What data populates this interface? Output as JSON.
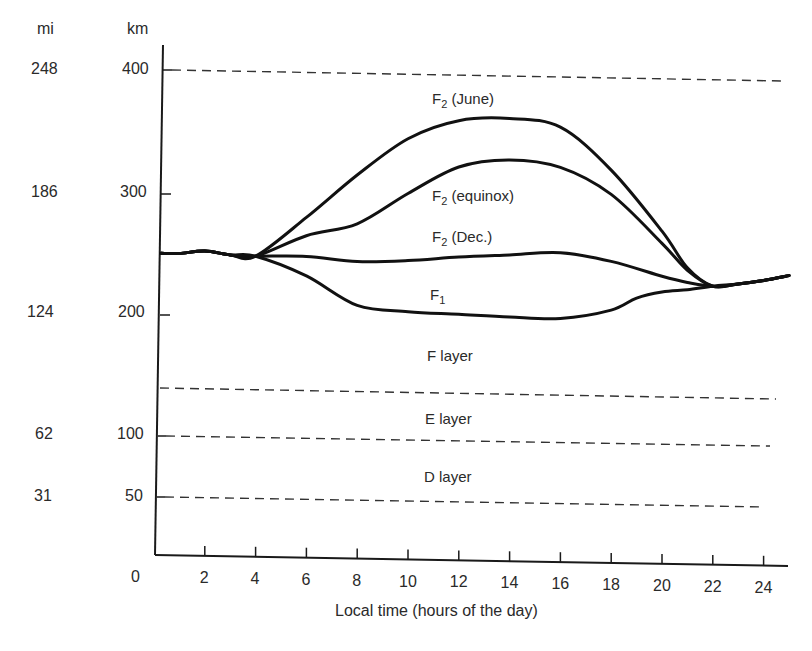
{
  "chart_data": {
    "type": "line",
    "title": "",
    "xlabel": "Local time (hours of the day)",
    "ylabel_left_outer": "mi",
    "ylabel_left_inner": "km",
    "x_ticks": [
      0,
      2,
      4,
      6,
      8,
      10,
      12,
      14,
      16,
      18,
      20,
      22,
      24
    ],
    "y_ticks_km": [
      50,
      100,
      200,
      300,
      400
    ],
    "y_ticks_mi": [
      31,
      62,
      124,
      186,
      248
    ],
    "xlim": [
      0,
      25
    ],
    "ylim_km": [
      0,
      420
    ],
    "grid": false,
    "reference_lines": [
      {
        "name": "top-400km",
        "km": 400,
        "style": "dashed"
      },
      {
        "name": "F/E boundary",
        "km": 140,
        "style": "dashed"
      },
      {
        "name": "E/D boundary",
        "km": 100,
        "style": "dashed"
      },
      {
        "name": "D lower",
        "km": 50,
        "style": "dashed"
      }
    ],
    "region_labels": [
      "F layer",
      "E layer",
      "D layer"
    ],
    "series": [
      {
        "name": "F2 (June)",
        "x": [
          0,
          1,
          2,
          3,
          4,
          6,
          8,
          10,
          12,
          14,
          16,
          18,
          20,
          21,
          22,
          23,
          24,
          25
        ],
        "km": [
          250,
          250,
          252,
          249,
          248,
          280,
          315,
          345,
          360,
          362,
          355,
          320,
          270,
          240,
          225,
          227,
          230,
          234
        ]
      },
      {
        "name": "F2 (equinox)",
        "x": [
          0,
          1,
          2,
          3,
          4,
          6,
          8,
          10,
          12,
          14,
          16,
          18,
          20,
          21,
          22,
          23,
          24,
          25
        ],
        "km": [
          250,
          250,
          252,
          249,
          248,
          265,
          275,
          300,
          322,
          328,
          322,
          300,
          260,
          238,
          225,
          227,
          230,
          234
        ]
      },
      {
        "name": "F2 (Dec.)",
        "x": [
          0,
          1,
          2,
          3,
          4,
          6,
          8,
          10,
          12,
          14,
          16,
          18,
          20,
          21,
          22,
          23,
          24,
          25
        ],
        "km": [
          250,
          250,
          252,
          249,
          248,
          248,
          244,
          245,
          248,
          250,
          252,
          245,
          233,
          228,
          225,
          227,
          230,
          234
        ]
      },
      {
        "name": "F1",
        "x": [
          0,
          1,
          2,
          3,
          4,
          6,
          8,
          10,
          12,
          14,
          16,
          18,
          19,
          20,
          21,
          22,
          23,
          24,
          25
        ],
        "km": [
          250,
          250,
          252,
          249,
          248,
          232,
          208,
          203,
          201,
          199,
          198,
          205,
          215,
          220,
          222,
          225,
          227,
          230,
          234
        ]
      }
    ],
    "series_labels": [
      "F2 (June)",
      "F2 (equinox)",
      "F2 (Dec.)",
      "F1"
    ]
  },
  "labels": {
    "mi_header": "mi",
    "km_header": "km",
    "mi_ticks": [
      "248",
      "186",
      "124",
      "62",
      "31"
    ],
    "km_ticks": [
      "400",
      "300",
      "200",
      "100",
      "50"
    ],
    "x_ticks": [
      "0",
      "2",
      "4",
      "6",
      "8",
      "10",
      "12",
      "14",
      "16",
      "18",
      "20",
      "22",
      "24"
    ],
    "xlabel": "Local time (hours of the day)",
    "f2_june": {
      "main": "F",
      "sub": "2",
      "rest": " (June)"
    },
    "f2_equinox": {
      "main": "F",
      "sub": "2",
      "rest": " (equinox)"
    },
    "f2_dec": {
      "main": "F",
      "sub": "2",
      "rest": " (Dec.)"
    },
    "f1": {
      "main": "F",
      "sub": "1",
      "rest": ""
    },
    "f_layer": "F layer",
    "e_layer": "E layer",
    "d_layer": "D layer"
  }
}
